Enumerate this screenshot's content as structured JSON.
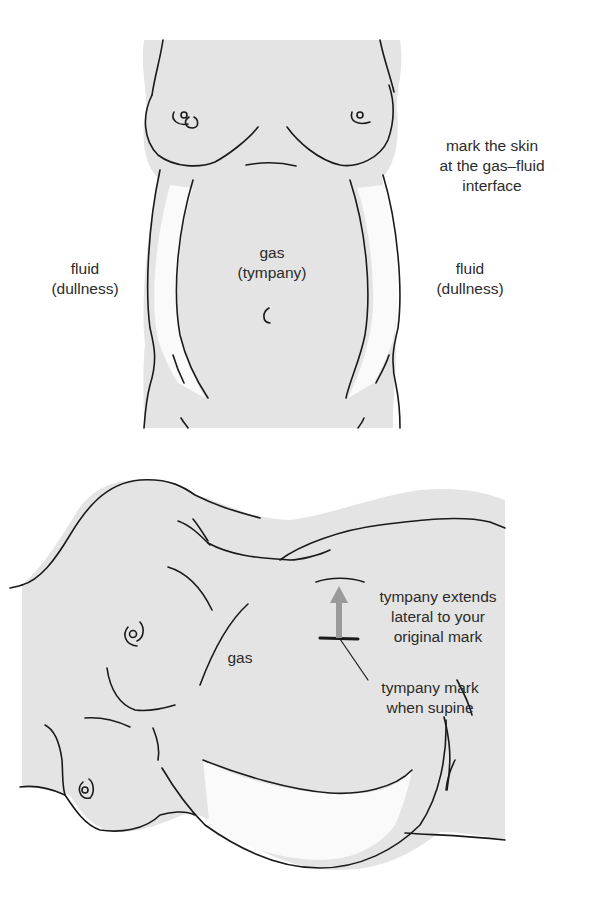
{
  "colors": {
    "background": "#ffffff",
    "body_fill": "#e4e4e4",
    "fluid_fill": "#fafafa",
    "outline": "#1a1a1a",
    "arrow": "#9a9a9a",
    "text": "#2b2b2b"
  },
  "top_figure": {
    "description": "supine patient, frontal view",
    "labels": {
      "annotation": [
        "mark the skin",
        "at the gas–fluid",
        "interface"
      ],
      "center": [
        "gas",
        "(tympany)"
      ],
      "left": [
        "fluid",
        "(dullness)"
      ],
      "right": [
        "fluid",
        "(dullness)"
      ]
    }
  },
  "bottom_figure": {
    "description": "patient lying on side (lateral decubitus)",
    "labels": {
      "gas": "gas",
      "extends": [
        "tympany extends",
        "lateral to your",
        "original mark"
      ],
      "supine_mark": [
        "tympany mark",
        "when supine"
      ]
    },
    "arrow": {
      "direction": "up",
      "color": "#9a9a9a"
    }
  }
}
